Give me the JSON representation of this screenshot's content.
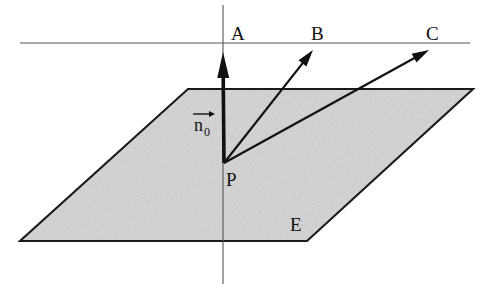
{
  "figure": {
    "background_color": "#ffffff",
    "plane": {
      "name": "E",
      "label": "E",
      "label_x": 290,
      "label_y": 231,
      "fill_color": "#d4d4d4",
      "stroke_color": "#1a1a1a",
      "corners": [
        {
          "x": 188,
          "y": 89
        },
        {
          "x": 473,
          "y": 89
        },
        {
          "x": 307,
          "y": 241
        },
        {
          "x": 20,
          "y": 241
        }
      ]
    },
    "point": {
      "name": "P",
      "label": "P",
      "x": 224,
      "y": 163,
      "label_x": 226,
      "label_y": 186
    },
    "horizontal_line": {
      "x1": 20,
      "y1": 43,
      "x2": 470,
      "y2": 43,
      "color": "#555555"
    },
    "vertical_line": {
      "x1": 223,
      "y1": 5,
      "x2": 223,
      "y2": 284,
      "color": "#555555"
    },
    "normal_vector": {
      "label_main": "n",
      "label_sub": "0",
      "label_x": 193,
      "label_y": 131,
      "from_x": 224,
      "from_y": 163,
      "to_x": 223,
      "to_y": 52,
      "color": "#111111"
    },
    "rays": [
      {
        "label": "A",
        "label_x": 231,
        "label_y": 40,
        "from_x": 224,
        "from_y": 163,
        "to_x": 223,
        "to_y": 52,
        "color": "#111111",
        "thick": true
      },
      {
        "label": "B",
        "label_x": 311,
        "label_y": 40,
        "from_x": 224,
        "from_y": 163,
        "to_x": 313,
        "to_y": 50,
        "color": "#111111",
        "thick": false
      },
      {
        "label": "C",
        "label_x": 426,
        "label_y": 40,
        "from_x": 224,
        "from_y": 163,
        "to_x": 429,
        "to_y": 50,
        "color": "#111111",
        "thick": false
      }
    ]
  }
}
